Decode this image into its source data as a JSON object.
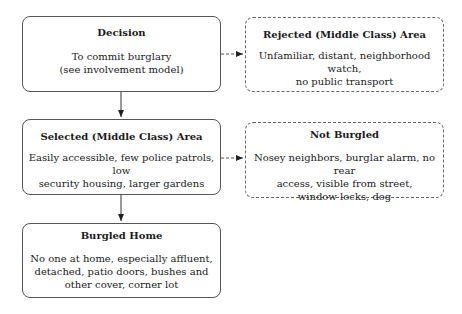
{
  "nodes": {
    "decision": {
      "title": "Decision",
      "lines": [
        "To commit burglary",
        "(see involvement model)"
      ]
    },
    "rejected": {
      "title": "Rejected (Middle Class) Area",
      "lines": [
        "Unfamiliar, distant, neighborhood watch,",
        "no public transport"
      ]
    },
    "selected": {
      "title": "Selected (Middle Class) Area",
      "lines": [
        "Easily accessible, few police patrols, low",
        "security housing, larger gardens"
      ]
    },
    "not_burgled": {
      "title": "Not Burgled",
      "lines": [
        "Nosey neighbors, burglar alarm, no rear",
        "access, visible from street,",
        "window locks, dog"
      ]
    },
    "burgled": {
      "title": "Burgled Home",
      "lines": [
        "No  one at home, especially affluent,",
        "detached, patio doors, bushes and",
        "other cover, corner lot"
      ]
    }
  },
  "edges": [
    {
      "from": "decision",
      "to": "selected",
      "style": "solid"
    },
    {
      "from": "decision",
      "to": "rejected",
      "style": "dashed"
    },
    {
      "from": "selected",
      "to": "burgled",
      "style": "solid"
    },
    {
      "from": "selected",
      "to": "not_burgled",
      "style": "dashed"
    }
  ]
}
